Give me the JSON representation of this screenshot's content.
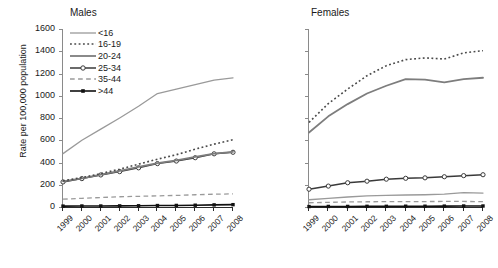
{
  "figure": {
    "ylabel": "Rate per 100,000 population",
    "y_ticks": [
      "0",
      "200",
      "400",
      "600",
      "800",
      "1000",
      "1200",
      "1400",
      "1600"
    ],
    "x_ticks": [
      "1999",
      "2000",
      "2001",
      "2002",
      "2003",
      "2004",
      "2005",
      "2006",
      "2007",
      "2008"
    ],
    "legend_title": "",
    "colors": {
      "lt16": "#9a9a9a",
      "a16_19": "#4a4a4a",
      "a20_24": "#7d7d7d",
      "a25_34": "#3a3a3a",
      "a35_44": "#9a9a9a",
      "gt44": "#111111",
      "axis": "#2b2b2b",
      "text": "#1a1a1a"
    }
  },
  "panels": [
    {
      "id": "males",
      "title": "Males"
    },
    {
      "id": "females",
      "title": "Females"
    }
  ],
  "legend": {
    "items": [
      {
        "label": "<16",
        "style": "solid",
        "marker": "none",
        "color": "#9a9a9a",
        "width": 1.3
      },
      {
        "label": "16-19",
        "style": "dotted",
        "marker": "none",
        "color": "#4a4a4a",
        "width": 1.6
      },
      {
        "label": "20-24",
        "style": "solid",
        "marker": "none",
        "color": "#7d7d7d",
        "width": 1.8
      },
      {
        "label": "25-34",
        "style": "solid",
        "marker": "circle",
        "color": "#3a3a3a",
        "width": 1.5
      },
      {
        "label": "35-44",
        "style": "dashed",
        "marker": "none",
        "color": "#9a9a9a",
        "width": 1.3
      },
      {
        "label": ">44",
        "style": "solid",
        "marker": "square",
        "color": "#111111",
        "width": 1.6
      }
    ]
  },
  "chart_data": [
    {
      "type": "line",
      "title": "Males",
      "xlabel": "",
      "ylabel": "Rate per 100,000 population",
      "x": [
        1999,
        2000,
        2001,
        2002,
        2003,
        2004,
        2005,
        2006,
        2007,
        2008
      ],
      "ylim": [
        0,
        1600
      ],
      "ytick_step": 200,
      "grid": false,
      "legend_position": "upper-left-inside",
      "series": [
        {
          "name": "<16",
          "values": [
            480,
            600,
            700,
            800,
            905,
            1020,
            1060,
            1100,
            1140,
            1160
          ]
        },
        {
          "name": "16-19",
          "values": [
            235,
            265,
            300,
            340,
            385,
            430,
            470,
            520,
            565,
            605
          ]
        },
        {
          "name": "20-24",
          "values": [
            230,
            258,
            290,
            325,
            360,
            395,
            420,
            450,
            480,
            495
          ]
        },
        {
          "name": "25-34",
          "values": [
            225,
            255,
            288,
            318,
            352,
            390,
            413,
            443,
            478,
            492
          ]
        },
        {
          "name": "35-44",
          "values": [
            70,
            78,
            85,
            92,
            96,
            100,
            104,
            110,
            115,
            118
          ]
        },
        {
          "name": ">44",
          "values": [
            8,
            9,
            9,
            10,
            11,
            13,
            14,
            16,
            19,
            21
          ]
        }
      ]
    },
    {
      "type": "line",
      "title": "Females",
      "xlabel": "",
      "ylabel": "",
      "x": [
        1999,
        2000,
        2001,
        2002,
        2003,
        2004,
        2005,
        2006,
        2007,
        2008
      ],
      "ylim": [
        0,
        1600
      ],
      "ytick_step": 200,
      "grid": false,
      "legend_position": "none",
      "series": [
        {
          "name": "<16",
          "values": [
            65,
            78,
            90,
            100,
            105,
            108,
            110,
            115,
            130,
            125
          ]
        },
        {
          "name": "16-19",
          "values": [
            760,
            930,
            1060,
            1180,
            1270,
            1325,
            1340,
            1330,
            1385,
            1405
          ]
        },
        {
          "name": "20-24",
          "values": [
            670,
            815,
            925,
            1020,
            1090,
            1150,
            1145,
            1120,
            1150,
            1162
          ]
        },
        {
          "name": "25-34",
          "values": [
            160,
            188,
            218,
            232,
            250,
            258,
            262,
            272,
            282,
            290
          ]
        },
        {
          "name": "35-44",
          "values": [
            38,
            42,
            45,
            47,
            48,
            48,
            49,
            50,
            50,
            48
          ]
        },
        {
          "name": ">44",
          "values": [
            4,
            5,
            5,
            6,
            6,
            7,
            7,
            8,
            9,
            9
          ]
        }
      ]
    }
  ]
}
